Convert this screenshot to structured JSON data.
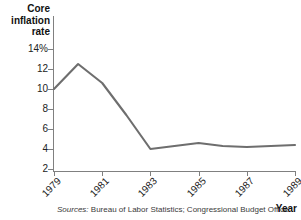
{
  "chart_data": {
    "type": "line",
    "title": "",
    "xlabel": "Year",
    "ylabel": "Core inflation rate",
    "x": [
      1979,
      1980,
      1981,
      1982,
      1983,
      1984,
      1985,
      1986,
      1987,
      1988,
      1989
    ],
    "values": [
      10.0,
      12.5,
      10.6,
      7.4,
      4.0,
      4.3,
      4.6,
      4.3,
      4.2,
      4.3,
      4.4
    ],
    "series": [
      {
        "name": "Core inflation rate",
        "values": [
          10.0,
          12.5,
          10.6,
          7.4,
          4.0,
          4.3,
          4.6,
          4.3,
          4.2,
          4.3,
          4.4
        ]
      }
    ],
    "xlim": [
      1979,
      1989
    ],
    "ylim": [
      1.0,
      14.0
    ],
    "ytick_labels": [
      "14%",
      "12",
      "10",
      "8",
      "6",
      "4",
      "2"
    ],
    "ytick_values": [
      14,
      12,
      10,
      8,
      6,
      4,
      2
    ],
    "xtick_labels": [
      "1979",
      "1981",
      "1983",
      "1985",
      "1987",
      "1989"
    ],
    "xtick_values": [
      1979,
      1981,
      1983,
      1985,
      1987,
      1989
    ],
    "grid": false,
    "legend": false,
    "line_color": "#6e6e6e",
    "axis_color": "#808080"
  },
  "axes": {
    "y_caption": "Core\ninflation\nrate",
    "y_caption_lines": [
      "Core",
      "inflation",
      "rate"
    ],
    "x_caption": "Year"
  },
  "footer": {
    "sources_lead": "Sources:",
    "sources_text": " Bureau of Labor Statistics; Congressional Budget Office."
  }
}
